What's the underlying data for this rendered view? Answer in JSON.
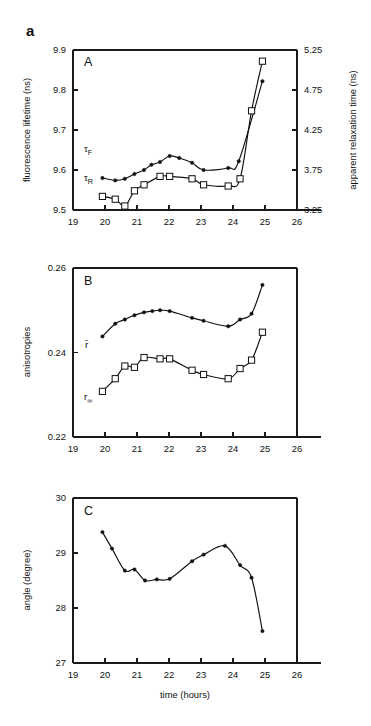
{
  "figure": {
    "tag": "a",
    "xlabel": "time (hours)",
    "x_ticks": [
      "19",
      "20",
      "21",
      "22",
      "23",
      "24",
      "25",
      "26"
    ],
    "x_tick_values": [
      19,
      20,
      21,
      22,
      23,
      24,
      25,
      26
    ],
    "xlim": [
      19,
      26
    ],
    "accent_color": "#111111",
    "background_color": "#ffffff"
  },
  "panels": {
    "a": {
      "letter": "A",
      "ylabel_left": "fluorescence lifetime  (ns)",
      "ylabel_right": "apparent relaxation time (ns)",
      "y_ticks_left": [
        "9.5",
        "9.6",
        "9.7",
        "9.8",
        "9.9"
      ],
      "y_ticks_right": [
        "3.25",
        "3.75",
        "4.25",
        "4.75",
        "5.25"
      ],
      "series_label_1": "τ",
      "series_label_1_sub": "F",
      "series_label_2": "τ",
      "series_label_2_sub": "R"
    },
    "b": {
      "letter": "B",
      "ylabel_left": "anisotropies",
      "y_ticks_left": [
        "0.22",
        "0.24",
        "0.26"
      ],
      "series_label_1": "r̄",
      "series_label_2": "r",
      "series_label_2_sub": "∞"
    },
    "c": {
      "letter": "C",
      "ylabel_left": "angle (degree)",
      "y_ticks_left": [
        "27",
        "28",
        "29",
        "30"
      ]
    }
  },
  "chart_data": [
    {
      "id": "panel-a",
      "type": "scatter",
      "title": "A",
      "xlabel": "time (hours)",
      "ylabel": "fluorescence lifetime  (ns)",
      "ylabel_secondary": "apparent relaxation time (ns)",
      "xlim": [
        19,
        26
      ],
      "ylim": [
        9.5,
        9.9
      ],
      "ylim_secondary": [
        3.25,
        5.25
      ],
      "xticks": [
        19,
        20,
        21,
        22,
        23,
        24,
        25,
        26
      ],
      "yticks": [
        9.5,
        9.6,
        9.7,
        9.8,
        9.9
      ],
      "yticks_secondary": [
        3.25,
        3.75,
        4.25,
        4.75,
        5.25
      ],
      "grid": false,
      "legend": "inline-labels",
      "series": [
        {
          "name": "τF",
          "axis": "left",
          "marker": "filled-circle",
          "x": [
            19.92,
            20.32,
            20.62,
            20.92,
            21.22,
            21.45,
            21.72,
            22.02,
            22.32,
            22.72,
            23.08,
            23.85,
            24.18,
            24.92
          ],
          "y": [
            9.58,
            9.574,
            9.578,
            9.59,
            9.6,
            9.613,
            9.62,
            9.635,
            9.63,
            9.618,
            9.6,
            9.605,
            9.622,
            9.822
          ]
        },
        {
          "name": "τR",
          "axis": "right",
          "marker": "open-square",
          "x": [
            19.92,
            20.32,
            20.62,
            20.92,
            21.22,
            21.72,
            22.02,
            22.72,
            23.08,
            23.85,
            24.22,
            24.58,
            24.92
          ],
          "y": [
            9.534,
            9.527,
            9.51,
            9.548,
            9.563,
            9.584,
            9.584,
            9.578,
            9.563,
            9.56,
            9.578,
            9.748,
            9.872
          ]
        }
      ]
    },
    {
      "id": "panel-b",
      "type": "scatter",
      "title": "B",
      "xlabel": "time (hours)",
      "ylabel": "anisotropies",
      "xlim": [
        19,
        26
      ],
      "ylim": [
        0.22,
        0.26
      ],
      "xticks": [
        19,
        20,
        21,
        22,
        23,
        24,
        25,
        26
      ],
      "yticks": [
        0.22,
        0.24,
        0.26
      ],
      "grid": false,
      "legend": "inline-labels",
      "series": [
        {
          "name": "r̄",
          "marker": "filled-circle",
          "x": [
            19.92,
            20.32,
            20.62,
            20.92,
            21.22,
            21.48,
            21.72,
            22.02,
            22.72,
            23.08,
            23.85,
            24.22,
            24.58,
            24.92
          ],
          "y": [
            0.2438,
            0.2468,
            0.2478,
            0.2488,
            0.2495,
            0.2498,
            0.25,
            0.2498,
            0.2482,
            0.2475,
            0.2462,
            0.2478,
            0.2492,
            0.256
          ]
        },
        {
          "name": "r∞",
          "marker": "open-square",
          "x": [
            19.92,
            20.32,
            20.62,
            20.92,
            21.22,
            21.72,
            22.02,
            22.72,
            23.08,
            23.85,
            24.22,
            24.58,
            24.92
          ],
          "y": [
            0.2308,
            0.2338,
            0.2368,
            0.2365,
            0.2388,
            0.2385,
            0.2385,
            0.2358,
            0.2348,
            0.2338,
            0.2362,
            0.2382,
            0.2448
          ]
        }
      ]
    },
    {
      "id": "panel-c",
      "type": "scatter",
      "title": "C",
      "xlabel": "time (hours)",
      "ylabel": "angle (degree)",
      "xlim": [
        19,
        26
      ],
      "ylim": [
        27,
        30
      ],
      "xticks": [
        19,
        20,
        21,
        22,
        23,
        24,
        25,
        26
      ],
      "yticks": [
        27,
        28,
        29,
        30
      ],
      "grid": false,
      "series": [
        {
          "name": "angle",
          "marker": "filled-circle",
          "x": [
            19.92,
            20.22,
            20.62,
            20.92,
            21.25,
            21.62,
            22.02,
            22.72,
            23.08,
            23.75,
            24.22,
            24.58,
            24.92
          ],
          "y": [
            29.38,
            29.08,
            28.68,
            28.7,
            28.5,
            28.52,
            28.53,
            28.85,
            28.97,
            29.13,
            28.78,
            28.55,
            27.58
          ]
        }
      ]
    }
  ]
}
